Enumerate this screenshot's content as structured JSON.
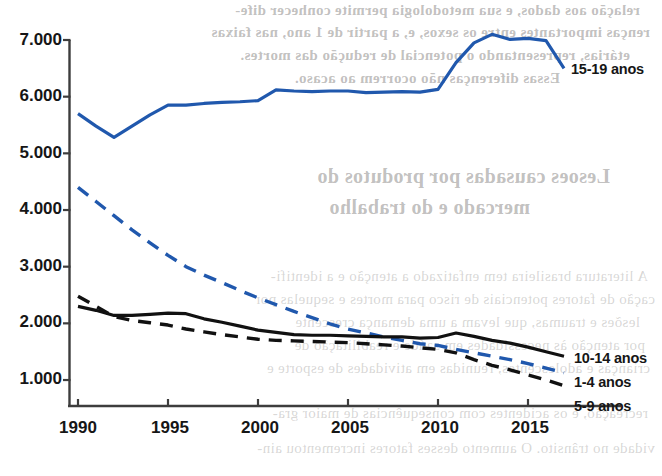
{
  "chart_data": {
    "type": "line",
    "title": "",
    "subtitle": "",
    "xlabel": "",
    "ylabel": "",
    "xlim": [
      1990,
      2017
    ],
    "ylim": [
      466,
      7100
    ],
    "grid": false,
    "legend_position": "right-inline",
    "x_ticks": [
      "1990",
      "1995",
      "2000",
      "2005",
      "2010",
      "2015"
    ],
    "x_tick_values": [
      1990,
      1995,
      2000,
      2005,
      2010,
      2015
    ],
    "y_ticks": [
      "1.000",
      "2.000",
      "3.000",
      "4.000",
      "5.000",
      "6.000",
      "7.000"
    ],
    "y_tick_values": [
      1000,
      2000,
      3000,
      4000,
      5000,
      6000,
      7000
    ],
    "x": [
      1990,
      1991,
      1992,
      1993,
      1994,
      1995,
      1996,
      1997,
      1998,
      1999,
      2000,
      2001,
      2002,
      2003,
      2004,
      2005,
      2006,
      2007,
      2008,
      2009,
      2010,
      2011,
      2012,
      2013,
      2014,
      2015,
      2016,
      2017
    ],
    "series": [
      {
        "name": "15-19 anos",
        "color": "#2058ad",
        "style": "solid",
        "label_x": 2017,
        "label_y": 6500,
        "values": [
          5700,
          5480,
          5280,
          5480,
          5680,
          5850,
          5850,
          5880,
          5900,
          5910,
          5930,
          6120,
          6100,
          6090,
          6100,
          6100,
          6070,
          6080,
          6090,
          6080,
          6130,
          6600,
          6950,
          7100,
          7010,
          7030,
          6990,
          6500
        ]
      },
      {
        "name": "1-4 anos",
        "color": "#2058ad",
        "style": "dashed",
        "label_x": 2017,
        "label_y": 1150,
        "values": [
          4400,
          4150,
          3900,
          3650,
          3420,
          3200,
          3000,
          2850,
          2720,
          2580,
          2450,
          2330,
          2210,
          2100,
          1990,
          1900,
          1830,
          1760,
          1700,
          1640,
          1610,
          1540,
          1480,
          1420,
          1360,
          1290,
          1210,
          1130
        ]
      },
      {
        "name": "10-14 anos",
        "color": "#111111",
        "style": "solid",
        "label_x": 2017,
        "label_y": 1430,
        "values": [
          2300,
          2230,
          2140,
          2140,
          2160,
          2180,
          2170,
          2080,
          2020,
          1950,
          1880,
          1840,
          1800,
          1790,
          1790,
          1780,
          1770,
          1760,
          1760,
          1740,
          1750,
          1830,
          1770,
          1700,
          1650,
          1580,
          1500,
          1420
        ]
      },
      {
        "name": "5-9 anos",
        "color": "#111111",
        "style": "dashed",
        "label_x": 2017,
        "label_y": 900,
        "values": [
          2480,
          2300,
          2120,
          2050,
          2010,
          1970,
          1900,
          1850,
          1800,
          1760,
          1720,
          1700,
          1690,
          1680,
          1670,
          1660,
          1640,
          1620,
          1600,
          1570,
          1540,
          1480,
          1360,
          1260,
          1180,
          1090,
          1000,
          900
        ]
      }
    ]
  },
  "axis": {
    "y_label_1000": "1.000",
    "y_label_2000": "2.000",
    "y_label_3000": "3.000",
    "y_label_4000": "4.000",
    "y_label_5000": "5.000",
    "y_label_6000": "6.000",
    "y_label_7000": "7.000",
    "x_label_1990": "1990",
    "x_label_1995": "1995",
    "x_label_2000": "2000",
    "x_label_2005": "2005",
    "x_label_2010": "2010",
    "x_label_2015": "2015"
  },
  "legend": {
    "item_15_19": "15-19 anos",
    "item_10_14": "10-14 anos",
    "item_1_4": "1-4 anos",
    "item_5_9": "5-9 anos"
  },
  "background_text": {
    "line1": "relação aos dados, e sua metodologia permite conhecer dife-",
    "line2": "renças importantes entre os sexos, e, a partir de 1 ano, nas faixas",
    "line3": "etárias, representando o potencial de redução das mortes.",
    "line4": "Essas diferenças não ocorrem ao acaso.",
    "heading1": "Lesoes causadas por produtos do",
    "heading2": "mercado e do trabalho",
    "para1": "A literatura brasileira tem enfatizado a atenção e a identifi-",
    "para2": "cação de fatores potenciais de risco para mortes e sequelas por",
    "para3": "lesões e traumas, que levam a uma demança crescente",
    "para4": "por atenção às necessidades em saúde e reabilitação de",
    "para5": "crianças e adolescentes, reunidas em atividades de esporte e",
    "para6": "recreação, e os acidentes com consequências de maior gra-",
    "para7": "vidade no trânsito. O aumento desses fatores incrementou ain-"
  },
  "colors": {
    "blue": "#2058ad",
    "black": "#111111",
    "axis": "#3d3d3d"
  }
}
